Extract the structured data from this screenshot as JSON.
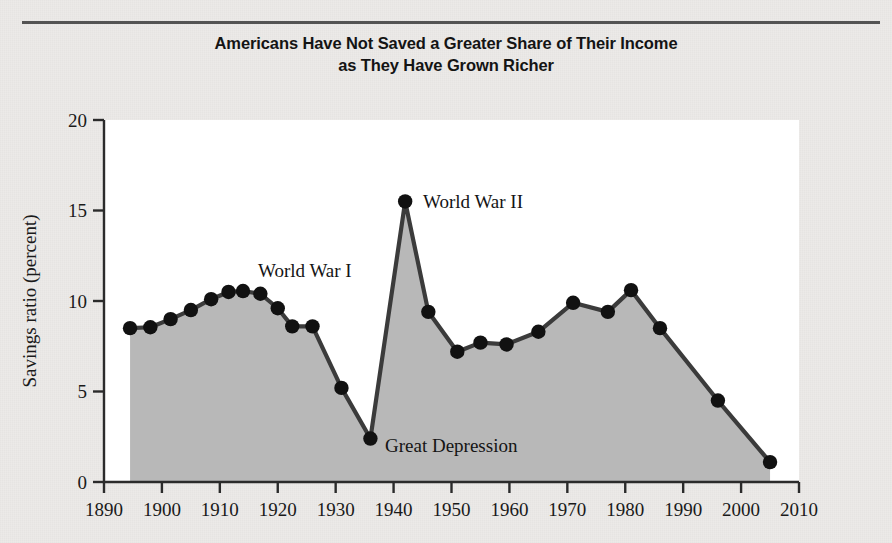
{
  "figure": {
    "title_line1": "Americans Have Not Saved a Greater Share of Their Income",
    "title_line2": "as They Have Grown Richer"
  },
  "colors": {
    "page_background": "#eceae8",
    "plot_background": "#ffffff",
    "area_fill": "#b8b8b8",
    "line": "#3b3b3b",
    "marker": "#111111",
    "axis": "#2b2b2b",
    "text": "#141414"
  },
  "chart_data": {
    "type": "area",
    "title": "Americans Have Not Saved a Greater Share of Their Income as They Have Grown Richer",
    "xlabel": "",
    "ylabel": "Savings ratio (percent)",
    "xlim": [
      1890,
      2010
    ],
    "ylim": [
      0,
      20
    ],
    "xticks": [
      1890,
      1900,
      1910,
      1920,
      1930,
      1940,
      1950,
      1960,
      1970,
      1980,
      1990,
      2000,
      2010
    ],
    "xtick_labels": [
      "1890",
      "1900",
      "1910",
      "1920",
      "1930",
      "1940",
      "1950",
      "1960",
      "1970",
      "1980",
      "1990",
      "2000",
      "2010"
    ],
    "yticks": [
      0,
      5,
      10,
      15,
      20
    ],
    "ytick_labels": [
      "0",
      "5",
      "10",
      "15",
      "20"
    ],
    "grid": false,
    "legend": null,
    "markers": true,
    "series": [
      {
        "name": "Savings ratio",
        "x": [
          1894.5,
          1898,
          1901.5,
          1905,
          1908.5,
          1911.5,
          1914,
          1917,
          1920,
          1922.5,
          1926,
          1931,
          1936,
          1942,
          1946,
          1951,
          1955,
          1959.5,
          1965,
          1971,
          1977,
          1981,
          1986,
          1996,
          2005
        ],
        "values": [
          8.5,
          8.55,
          9.0,
          9.5,
          10.1,
          10.5,
          10.55,
          10.4,
          9.6,
          8.6,
          8.6,
          5.2,
          2.4,
          15.5,
          9.4,
          7.2,
          7.7,
          7.6,
          8.3,
          9.9,
          9.4,
          10.6,
          8.5,
          4.5,
          1.1
        ]
      }
    ],
    "annotations": [
      {
        "text": "World War I",
        "x": 1917,
        "y": 12.5
      },
      {
        "text": "World War II",
        "x": 1943.5,
        "y": 15.5
      },
      {
        "text": "Great Depression",
        "x": 1939,
        "y": 2.4
      }
    ]
  }
}
